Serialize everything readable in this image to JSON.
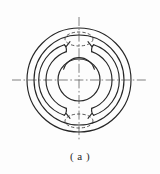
{
  "figure": {
    "caption": "( a )",
    "label_letter": "a",
    "kind": "engineering-drawing-front-view",
    "background_color": "#fdfdfd",
    "line_color": "#262626",
    "centerline_color": "#595959"
  },
  "geometry": {
    "center": {
      "x": 79,
      "y": 80
    },
    "outer_circle_outer": {
      "cx": 79,
      "cy": 80,
      "r": 52
    },
    "outer_circle_inner": {
      "cx": 79,
      "cy": 80,
      "r": 45
    },
    "slot_arc_outer": {
      "cx": 79,
      "cy": 80,
      "r": 37
    },
    "slot_arc_inner": {
      "cx": 79,
      "cy": 80,
      "r": 30
    },
    "bore_circle": {
      "cx": 79,
      "cy": 80,
      "r": 21
    },
    "bore_top_arc": {
      "cx": 79,
      "cy": 80,
      "r": 16
    },
    "hidden_ellipse_top": {
      "cx": 79,
      "cy": 39,
      "rx": 14,
      "ry": 7
    },
    "hidden_ellipse_bottom": {
      "cx": 79,
      "cy": 121,
      "rx": 14,
      "ry": 7
    },
    "horizontal_centerline": {
      "x1": 12,
      "y1": 80,
      "x2": 148,
      "y2": 80
    },
    "vertical_centerline": {
      "x1": 79,
      "y1": 17,
      "x2": 79,
      "y2": 141
    }
  },
  "linestyles": {
    "visible": "solid",
    "hidden": "dashed",
    "center": "dash-dot"
  },
  "elements": {
    "outer_rim_label": "outer rim circle",
    "inner_rim_label": "inner rim circle",
    "slot_label": "C-shaped slot",
    "bore_label": "central bore",
    "hidden_feature_label": "hidden ellipse"
  }
}
